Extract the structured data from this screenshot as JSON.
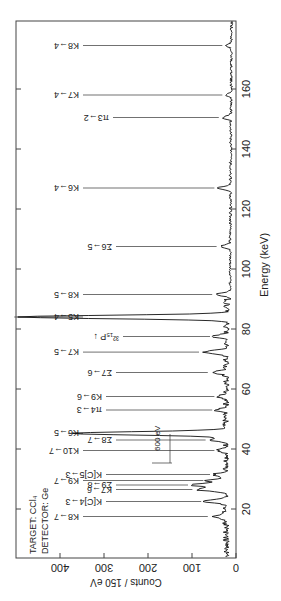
{
  "chart_data": {
    "type": "line",
    "title": "",
    "xlabel": "Energy   (keV)",
    "ylabel": "Counts / 150 eV",
    "xlim": [
      3.7,
      182.7
    ],
    "ylim": [
      0,
      500
    ],
    "x_ticks": [
      20,
      40,
      60,
      80,
      100,
      120,
      140,
      160
    ],
    "y_ticks": [
      0,
      100,
      200,
      300,
      400
    ],
    "grid": false,
    "orientation": "rotated 90 degrees counter-clockwise (energy axis vertical, counts increase to the left)",
    "info_text": [
      "TARGET: CCl₄",
      "DETECTOR: Ge"
    ],
    "resolution_marker": {
      "label": "600 eV",
      "energy_keV": 51.5
    },
    "baseline_counts": 20,
    "peaks": [
      {
        "label": "K8→7",
        "energy": 17.5,
        "counts": 55
      },
      {
        "label": "K[C]4→3",
        "energy": 22.5,
        "counts": 70
      },
      {
        "label": "K7→6",
        "energy": 26.5,
        "counts": 90
      },
      {
        "label": "Σ9→8",
        "energy": 28.0,
        "counts": 100
      },
      {
        "label": "K9→7",
        "energy": 29.5,
        "counts": 65
      },
      {
        "label": "K[C]5→3",
        "energy": 31.5,
        "counts": 50
      },
      {
        "label": "K10→7",
        "energy": 39.5,
        "counts": 40
      },
      {
        "label": "Σ8→7",
        "energy": 43.0,
        "counts": 60
      },
      {
        "label": "K6→5",
        "energy": 45.2,
        "counts": 373
      },
      {
        "label": "π4→3",
        "energy": 53.0,
        "counts": 45
      },
      {
        "label": "K9→6",
        "energy": 57.5,
        "counts": 40
      },
      {
        "label": "Σ7→6",
        "energy": 65.5,
        "counts": 55
      },
      {
        "label": "K7→5",
        "energy": 72.3,
        "counts": 75
      },
      {
        "label": "³²₁₅P",
        "energy": 77.5,
        "counts": 50
      },
      {
        "label": "K5→4",
        "energy": 84.0,
        "counts": 495
      },
      {
        "label": "K8→5",
        "energy": 91.5,
        "counts": 45
      },
      {
        "label": "Σ6→5",
        "energy": 107.5,
        "counts": 35
      },
      {
        "label": "K6→4",
        "energy": 127.0,
        "counts": 40
      },
      {
        "label": "π3→2",
        "energy": 150.5,
        "counts": 30
      },
      {
        "label": "K7→4",
        "energy": 158.0,
        "counts": 22
      },
      {
        "label": "K8→4",
        "energy": 174.5,
        "counts": 22
      }
    ]
  },
  "labels": {
    "xlabel": "Energy   (keV)",
    "ylabel": "Counts / 150 eV",
    "target": "TARGET: CCl₄",
    "detector": "DETECTOR: Ge",
    "res": "600 eV",
    "x_ticks": [
      "20",
      "40",
      "60",
      "80",
      "100",
      "120",
      "140",
      "160"
    ],
    "y_ticks": [
      "0",
      "100",
      "200",
      "300",
      "400"
    ],
    "peaks": [
      "K8→7",
      "K[C]4→3",
      "K7→6",
      "Σ9→8",
      "K9→7",
      "K[C]5→3",
      "K10→7",
      "Σ8→7",
      "K6→5",
      "π4→3",
      "K9→6",
      "Σ7→6",
      "K7→5",
      "³²₁₅P ↓",
      "K5→4",
      "K8→5",
      "Σ6→5",
      "K6→4",
      "π3→2",
      "K7→4",
      "K8→4"
    ]
  }
}
